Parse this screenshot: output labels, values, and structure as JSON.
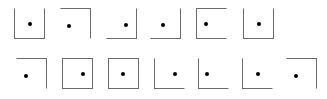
{
  "canvas": {
    "width": 327,
    "height": 99,
    "background_color": "#ffffff",
    "stroke_color": "#6b6b6b",
    "dot_color": "#000000",
    "description": "Array of thirteen open and closed square outlines, each containing a single small black dot"
  },
  "figures": {
    "row_1": [
      {
        "index": 1,
        "name": "figure-1",
        "shape": "u-shape",
        "sides": [
          "left",
          "bottom",
          "right"
        ],
        "missing_sides": [
          "top"
        ],
        "dot_x_pct": 50,
        "dot_y_pct": 52,
        "left": 8
      },
      {
        "index": 2,
        "name": "figure-2",
        "shape": "corner-top-right",
        "sides": [
          "top",
          "right"
        ],
        "missing_sides": [
          "bottom",
          "left"
        ],
        "dot_x_pct": 28,
        "dot_y_pct": 58,
        "left": 54
      },
      {
        "index": 3,
        "name": "figure-3",
        "shape": "corner-bottom-right",
        "sides": [
          "bottom",
          "right"
        ],
        "missing_sides": [
          "top",
          "left"
        ],
        "dot_x_pct": 66,
        "dot_y_pct": 55,
        "left": 100
      },
      {
        "index": 4,
        "name": "figure-4",
        "shape": "corner-bottom-right",
        "sides": [
          "bottom",
          "right"
        ],
        "missing_sides": [
          "top",
          "left"
        ],
        "dot_x_pct": 40,
        "dot_y_pct": 55,
        "left": 144
      },
      {
        "index": 5,
        "name": "figure-5",
        "shape": "c-shape",
        "sides": [
          "top",
          "left",
          "bottom"
        ],
        "missing_sides": [
          "right"
        ],
        "dot_x_pct": 32,
        "dot_y_pct": 52,
        "left": 190
      },
      {
        "index": 6,
        "name": "figure-6",
        "shape": "u-shape",
        "sides": [
          "left",
          "bottom",
          "right"
        ],
        "missing_sides": [
          "top"
        ],
        "dot_x_pct": 50,
        "dot_y_pct": 52,
        "left": 237
      }
    ],
    "row_2": [
      {
        "index": 7,
        "name": "figure-7",
        "shape": "corner-top-right",
        "sides": [
          "top",
          "right"
        ],
        "missing_sides": [
          "bottom",
          "left"
        ],
        "dot_x_pct": 30,
        "dot_y_pct": 58,
        "left": 10
      },
      {
        "index": 8,
        "name": "figure-8",
        "shape": "closed-square",
        "sides": [
          "top",
          "right",
          "bottom",
          "left"
        ],
        "missing_sides": [],
        "dot_x_pct": 68,
        "dot_y_pct": 50,
        "left": 56
      },
      {
        "index": 9,
        "name": "figure-9",
        "shape": "closed-square",
        "sides": [
          "top",
          "right",
          "bottom",
          "left"
        ],
        "missing_sides": [],
        "dot_x_pct": 48,
        "dot_y_pct": 52,
        "left": 102
      },
      {
        "index": 10,
        "name": "figure-10",
        "shape": "corner-bottom-left",
        "sides": [
          "left",
          "bottom"
        ],
        "missing_sides": [
          "top",
          "right"
        ],
        "dot_x_pct": 68,
        "dot_y_pct": 52,
        "left": 148
      },
      {
        "index": 11,
        "name": "figure-11",
        "shape": "corner-bottom-left",
        "sides": [
          "left",
          "bottom"
        ],
        "missing_sides": [
          "top",
          "right"
        ],
        "dot_x_pct": 26,
        "dot_y_pct": 52,
        "left": 192
      },
      {
        "index": 12,
        "name": "figure-12",
        "shape": "corner-bottom-left",
        "sides": [
          "left",
          "bottom"
        ],
        "missing_sides": [
          "top",
          "right"
        ],
        "dot_x_pct": 50,
        "dot_y_pct": 52,
        "left": 236
      },
      {
        "index": 13,
        "name": "figure-13",
        "shape": "corner-top-right",
        "sides": [
          "top",
          "right"
        ],
        "missing_sides": [
          "bottom",
          "left"
        ],
        "dot_x_pct": 30,
        "dot_y_pct": 58,
        "left": 280
      }
    ]
  }
}
